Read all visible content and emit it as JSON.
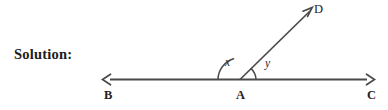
{
  "page": {
    "background_color": "#ffffff",
    "width": 388,
    "height": 110
  },
  "prompt": {
    "label": "Solution:"
  },
  "figure": {
    "name": "angle-diagram-BAC-with-ray-AD",
    "stroke_color": "#4a4a4a",
    "text_color": "#232323",
    "points": [
      {
        "id": "B",
        "label": "B",
        "x": 105,
        "y": 79
      },
      {
        "id": "A",
        "label": "A",
        "x": 240,
        "y": 79
      },
      {
        "id": "C",
        "label": "C",
        "x": 372,
        "y": 79
      },
      {
        "id": "D",
        "label": "D",
        "x": 312,
        "y": 9
      }
    ],
    "segments": [
      {
        "name": "line-BC",
        "from": "B",
        "to": "C",
        "arrow_start": true,
        "arrow_end": true
      },
      {
        "name": "ray-AD",
        "from": "A",
        "to": "D",
        "arrow_start": false,
        "arrow_end": true
      }
    ],
    "angles": [
      {
        "id": "x",
        "label": "x",
        "vertex": "A",
        "between": [
          "B",
          "D"
        ],
        "arc_radius": 22
      },
      {
        "id": "y",
        "label": "y",
        "vertex": "A",
        "between": [
          "D",
          "C"
        ],
        "arc_radius": 16
      }
    ]
  }
}
